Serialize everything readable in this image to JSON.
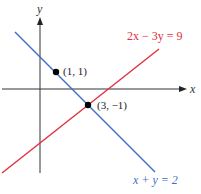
{
  "axes": {
    "x_label": "x",
    "y_label": "y"
  },
  "lines": [
    {
      "equation": "2x − 3y = 9",
      "color": "#e0303c"
    },
    {
      "equation": "x + y = 2",
      "color": "#3f6fc6"
    }
  ],
  "points": [
    {
      "label": "(1, 1)"
    },
    {
      "label": "(3, −1)"
    }
  ],
  "colors": {
    "axis": "#333333",
    "point": "#000000",
    "red_line": "#e0303c",
    "blue_line": "#3f6fc6"
  }
}
